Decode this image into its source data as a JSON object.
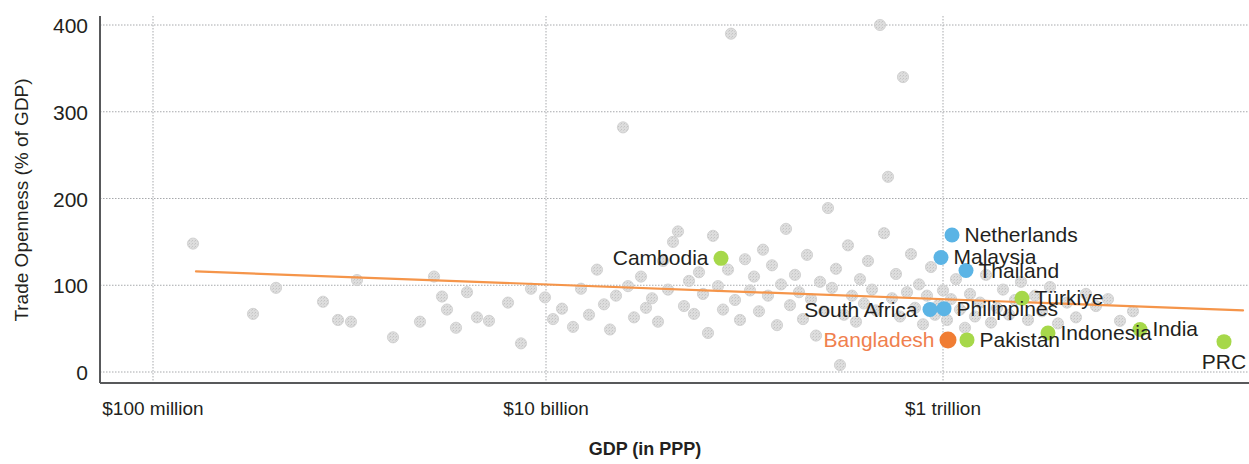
{
  "chart_data": {
    "type": "scatter",
    "title": "",
    "xlabel": "GDP (in PPP)",
    "ylabel": "Trade Openness (% of GDP)",
    "x_scale": "log",
    "x_tick_labels": [
      "$100 million",
      "$10 billion",
      "$1 trillion"
    ],
    "x_tick_values": [
      100000000,
      10000000000,
      1000000000000
    ],
    "y_tick_labels": [
      "0",
      "100",
      "200",
      "300",
      "400"
    ],
    "y_tick_values": [
      0,
      100,
      200,
      300,
      400
    ],
    "ylim": [
      0,
      415
    ],
    "grid": "both-dotted",
    "legend": "none",
    "colors": {
      "background_point": "#dddddd",
      "highlight_blue": "#5bb4e5",
      "highlight_green": "#a6d84a",
      "highlight_orange": "#f07d33",
      "label_highlight": "#f0804e",
      "trendline": "#f5954a",
      "axis": "#58595b",
      "grid": "#a7a9ac",
      "text": "#231f20"
    },
    "trendline": {
      "name": "linear fit",
      "x_start_px": 196,
      "y_start_value": 116,
      "x_end_px": 1243,
      "y_end_value": 71
    },
    "labeled_points": [
      {
        "name": "Cambodia",
        "label_side": "left",
        "color": "green",
        "gdp_px": 721,
        "openness": 131
      },
      {
        "name": "Netherlands",
        "label_side": "right",
        "color": "blue",
        "gdp_px": 952,
        "openness": 158
      },
      {
        "name": "Malaysia",
        "label_side": "right",
        "color": "blue",
        "gdp_px": 941,
        "openness": 132
      },
      {
        "name": "Thailand",
        "label_side": "right",
        "color": "blue",
        "gdp_px": 966,
        "openness": 117
      },
      {
        "name": "South Africa",
        "label_side": "left",
        "color": "blue",
        "gdp_px": 930,
        "openness": 72
      },
      {
        "name": "Philippines",
        "label_side": "right",
        "color": "blue",
        "gdp_px": 944,
        "openness": 73
      },
      {
        "name": "Türkiye",
        "label_side": "right",
        "color": "green",
        "gdp_px": 1022,
        "openness": 85
      },
      {
        "name": "Bangladesh",
        "label_side": "left",
        "color": "orange",
        "gdp_px": 948,
        "openness": 37,
        "highlight": true
      },
      {
        "name": "Pakistan",
        "label_side": "right",
        "color": "green",
        "gdp_px": 967,
        "openness": 37
      },
      {
        "name": "Indonesia",
        "label_side": "right",
        "color": "green",
        "gdp_px": 1048,
        "openness": 45
      },
      {
        "name": "India",
        "label_side": "right",
        "color": "green",
        "gdp_px": 1140,
        "openness": 49
      },
      {
        "name": "PRC",
        "label_side": "below",
        "color": "green",
        "gdp_px": 1224,
        "openness": 35
      }
    ],
    "background_points": [
      [
        193,
        148
      ],
      [
        276,
        97
      ],
      [
        253,
        67
      ],
      [
        357,
        106
      ],
      [
        393,
        40
      ],
      [
        323,
        81
      ],
      [
        338,
        60
      ],
      [
        351,
        58
      ],
      [
        434,
        110
      ],
      [
        442,
        87
      ],
      [
        420,
        58
      ],
      [
        467,
        92
      ],
      [
        447,
        72
      ],
      [
        456,
        51
      ],
      [
        477,
        63
      ],
      [
        489,
        59
      ],
      [
        508,
        80
      ],
      [
        521,
        33
      ],
      [
        531,
        96
      ],
      [
        545,
        86
      ],
      [
        553,
        61
      ],
      [
        562,
        73
      ],
      [
        573,
        52
      ],
      [
        581,
        96
      ],
      [
        589,
        66
      ],
      [
        597,
        118
      ],
      [
        604,
        78
      ],
      [
        610,
        49
      ],
      [
        616,
        88
      ],
      [
        623,
        282
      ],
      [
        628,
        99
      ],
      [
        634,
        63
      ],
      [
        641,
        110
      ],
      [
        646,
        74
      ],
      [
        652,
        85
      ],
      [
        658,
        58
      ],
      [
        663,
        128
      ],
      [
        668,
        95
      ],
      [
        673,
        150
      ],
      [
        678,
        162
      ],
      [
        684,
        76
      ],
      [
        689,
        105
      ],
      [
        694,
        67
      ],
      [
        699,
        115
      ],
      [
        703,
        90
      ],
      [
        708,
        45
      ],
      [
        713,
        157
      ],
      [
        718,
        99
      ],
      [
        723,
        72
      ],
      [
        728,
        118
      ],
      [
        731,
        390
      ],
      [
        735,
        83
      ],
      [
        740,
        60
      ],
      [
        745,
        130
      ],
      [
        750,
        94
      ],
      [
        754,
        110
      ],
      [
        759,
        70
      ],
      [
        763,
        141
      ],
      [
        768,
        88
      ],
      [
        772,
        123
      ],
      [
        777,
        54
      ],
      [
        781,
        101
      ],
      [
        786,
        165
      ],
      [
        790,
        77
      ],
      [
        795,
        112
      ],
      [
        799,
        92
      ],
      [
        803,
        61
      ],
      [
        807,
        135
      ],
      [
        811,
        84
      ],
      [
        816,
        42
      ],
      [
        820,
        104
      ],
      [
        824,
        70
      ],
      [
        828,
        189
      ],
      [
        832,
        97
      ],
      [
        836,
        119
      ],
      [
        840,
        8
      ],
      [
        844,
        66
      ],
      [
        848,
        146
      ],
      [
        852,
        88
      ],
      [
        856,
        58
      ],
      [
        860,
        107
      ],
      [
        864,
        79
      ],
      [
        868,
        128
      ],
      [
        872,
        95
      ],
      [
        876,
        71
      ],
      [
        880,
        400
      ],
      [
        884,
        160
      ],
      [
        888,
        225
      ],
      [
        892,
        85
      ],
      [
        896,
        113
      ],
      [
        900,
        64
      ],
      [
        903,
        340
      ],
      [
        907,
        92
      ],
      [
        911,
        136
      ],
      [
        915,
        74
      ],
      [
        919,
        101
      ],
      [
        923,
        55
      ],
      [
        927,
        88
      ],
      [
        931,
        121
      ],
      [
        935,
        66
      ],
      [
        939,
        78
      ],
      [
        943,
        94
      ],
      [
        947,
        60
      ],
      [
        951,
        84
      ],
      [
        956,
        107
      ],
      [
        960,
        72
      ],
      [
        965,
        51
      ],
      [
        970,
        90
      ],
      [
        975,
        64
      ],
      [
        980,
        80
      ],
      [
        986,
        112
      ],
      [
        991,
        57
      ],
      [
        997,
        74
      ],
      [
        1003,
        95
      ],
      [
        1009,
        66
      ],
      [
        1015,
        83
      ],
      [
        1021,
        104
      ],
      [
        1028,
        60
      ],
      [
        1035,
        88
      ],
      [
        1042,
        70
      ],
      [
        1050,
        98
      ],
      [
        1058,
        56
      ],
      [
        1067,
        80
      ],
      [
        1076,
        63
      ],
      [
        1086,
        90
      ],
      [
        1096,
        76
      ],
      [
        1108,
        84
      ],
      [
        1120,
        59
      ],
      [
        1133,
        70
      ]
    ]
  }
}
